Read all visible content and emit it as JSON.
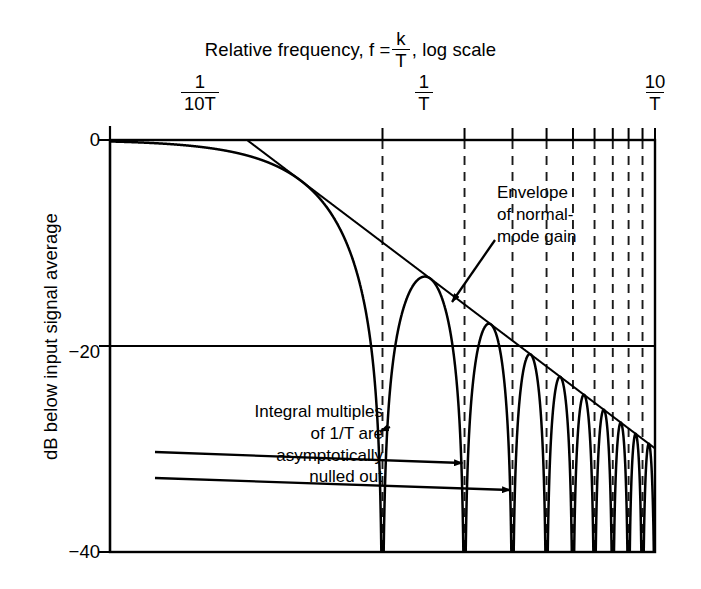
{
  "chart_data": {
    "type": "line",
    "title_parts": {
      "lead": "Relative frequency, f =",
      "numerator": "k",
      "denominator": "T",
      "trail": ", log scale"
    },
    "xlabel": "Relative frequency, f = k/T, log scale",
    "ylabel": "dB below input signal average",
    "x_scale": "log",
    "x_unit": "1/T",
    "xlim": [
      0.1,
      10
    ],
    "ylim": [
      -40,
      0
    ],
    "y_ticks": [
      0,
      -20,
      -40
    ],
    "y_tick_labels": [
      "0",
      "−20",
      "−40"
    ],
    "x_ticks": [
      0.1,
      1,
      10
    ],
    "x_tick_labels": [
      {
        "numerator": "1",
        "denominator": "10T"
      },
      {
        "numerator": "1",
        "denominator": "T"
      },
      {
        "numerator": "10",
        "denominator": "T"
      }
    ],
    "x_minor_ticks_kT": [
      1,
      2,
      3,
      4,
      5,
      6,
      7,
      8,
      9,
      10
    ],
    "grid": false,
    "gridlines": [
      {
        "orientation": "horizontal",
        "value": -20,
        "style": "solid"
      },
      {
        "orientation": "vertical",
        "value_kT": 0.1,
        "style": "solid"
      }
    ],
    "null_lines_kT": [
      1,
      2,
      3,
      4,
      5,
      6,
      7,
      8,
      9
    ],
    "null_line_style": "dashed",
    "series": [
      {
        "name": "Normal-mode response",
        "formula": "20*log10(|sin(pi*k)/(pi*k)|)",
        "style": "solid",
        "nulls_db": -25,
        "sidelobe_peaks_db": [
          -13.3,
          -17.8,
          -20.8,
          -23.0,
          -24.8,
          -26.2,
          -27.5,
          -28.6
        ]
      },
      {
        "name": "Envelope of normal-mode gain",
        "formula": "20*log10(1/(pi*k))",
        "style": "solid",
        "points_kT_db": [
          [
            0.1,
            -0.1
          ],
          [
            0.3,
            -0.4
          ],
          [
            0.5,
            -0.9
          ],
          [
            0.7,
            -2.0
          ],
          [
            1,
            -10.0
          ],
          [
            2,
            -16.0
          ],
          [
            3,
            -19.5
          ],
          [
            5,
            -23.9
          ],
          [
            7,
            -26.8
          ],
          [
            10,
            -29.9
          ]
        ]
      }
    ],
    "annotations": [
      {
        "id": "envelope-note",
        "lines": [
          "Envelope",
          "of normal-",
          "mode gain"
        ],
        "arrow": "points down-left to envelope curve"
      },
      {
        "id": "nulls-note",
        "lines": [
          "Integral multiples",
          "of 1/T are",
          "asymptotically",
          "nulled out"
        ],
        "arrow": "three arrows point right to nulls at 1/T, 2/T, 3/T",
        "arrow_targets_kT": [
          1,
          2,
          3
        ]
      }
    ],
    "colors": {
      "line": "#000000",
      "axis": "#000000",
      "dashed": "#1a1a1a",
      "background": "#ffffff"
    }
  }
}
